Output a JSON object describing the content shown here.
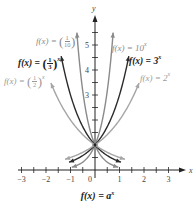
{
  "chart_data": {
    "type": "line",
    "title": "",
    "caption": "f(x) = a^x",
    "xlabel": "x",
    "ylabel": "y",
    "xlim": [
      -3,
      3
    ],
    "ylim": [
      0,
      5.5
    ],
    "x_ticks": [
      -3,
      -2,
      -1,
      0,
      1,
      2,
      3
    ],
    "y_ticks": [
      1,
      2,
      3,
      4,
      5
    ],
    "x_tick_labels": [
      "-3",
      "-2",
      "-1",
      "0",
      "1",
      "2",
      "3"
    ],
    "y_tick_labels": [
      "3",
      "4",
      "5"
    ],
    "minor_tick_step": 0.5,
    "grid": false,
    "legend": "inline labels",
    "intersection_point": [
      0,
      1
    ],
    "series": [
      {
        "name": "f(x) = 10^x",
        "base": 10,
        "color": "#8a8a8a",
        "weight": 1.4,
        "x_range": [
          -0.95,
          0.74
        ],
        "label_color": "#8a8a8a"
      },
      {
        "name": "f(x) = 3^x",
        "base": 3,
        "color": "#2b2b2b",
        "weight": 1.4,
        "x_range": [
          -1.06,
          1.38
        ],
        "label_color": "#222222"
      },
      {
        "name": "f(x) = 2^x",
        "base": 2,
        "color": "#a6a6a6",
        "weight": 1.4,
        "x_range": [
          -1.22,
          1.8
        ],
        "label_color": "#9a9a9a"
      },
      {
        "name": "f(x) = (1/10)^x",
        "base": 0.1,
        "color": "#8a8a8a",
        "weight": 1.4,
        "x_range": [
          -0.74,
          0.95
        ],
        "label_color": "#8a8a8a"
      },
      {
        "name": "f(x) = (1/3)^x",
        "base": 0.3333,
        "color": "#2b2b2b",
        "weight": 1.4,
        "x_range": [
          -1.38,
          1.06
        ],
        "label_color": "#222222"
      },
      {
        "name": "f(x) = (1/2)^x",
        "base": 0.5,
        "color": "#a6a6a6",
        "weight": 1.4,
        "x_range": [
          -1.8,
          1.22
        ],
        "label_color": "#9a9a9a"
      }
    ]
  },
  "labels": {
    "ten": {
      "prefix": "f(x) = 10",
      "exp": "x"
    },
    "three": {
      "prefix": "f(x) = 3",
      "exp": "x"
    },
    "two": {
      "prefix": "f(x) = 2",
      "exp": "x"
    },
    "tenth": {
      "prefix": "f(x) = ",
      "num": "1",
      "den": "10",
      "exp": "x"
    },
    "third": {
      "prefix": "f(x) = ",
      "num": "1",
      "den": "3",
      "exp": "x"
    },
    "half": {
      "prefix": "f(x) = ",
      "num": "1",
      "den": "2",
      "exp": "x"
    }
  },
  "caption": "f(x) = a",
  "caption_exp": "x"
}
